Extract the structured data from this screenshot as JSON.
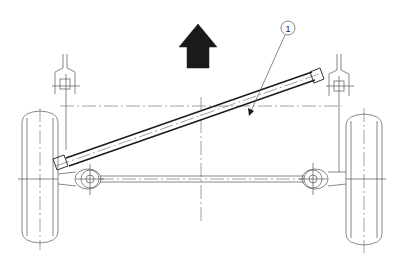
{
  "diagram": {
    "type": "technical-line-drawing",
    "callouts": [
      {
        "label": "1",
        "target": "diagonal-strut"
      }
    ],
    "direction_arrow": {
      "meaning": "forward direction",
      "orientation": "up"
    },
    "components": [
      "left-wheel",
      "right-wheel",
      "left-mount-bracket",
      "right-mount-bracket",
      "diagonal-strut",
      "tie-rod",
      "left-ball-joint",
      "right-ball-joint",
      "horizontal-centerline",
      "vertical-centerline"
    ],
    "colors": {
      "line": "#333333",
      "arrow_fill": "#1a1a1a",
      "background": "#ffffff"
    }
  }
}
